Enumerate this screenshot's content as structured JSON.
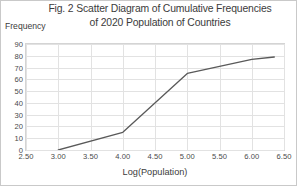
{
  "chart_data": {
    "type": "line",
    "title": "Fig. 2 Scatter Diagram of Cumulative Frequencies of 2020 Population of Countries",
    "title_line1": "Fig. 2 Scatter Diagram of Cumulative Frequencies",
    "title_line2": "of 2020 Population of Countries",
    "xlabel": "Log(Population)",
    "ylabel": "Frequency",
    "xlim": [
      2.5,
      6.5
    ],
    "ylim": [
      0,
      90
    ],
    "xticks": [
      "2.50",
      "3.00",
      "3.50",
      "4.00",
      "4.50",
      "5.00",
      "5.50",
      "6.00",
      "6.50"
    ],
    "xtick_values": [
      2.5,
      3.0,
      3.5,
      4.0,
      4.5,
      5.0,
      5.5,
      6.0,
      6.5
    ],
    "yticks": [
      "0",
      "10",
      "20",
      "30",
      "40",
      "50",
      "60",
      "70",
      "80",
      "90"
    ],
    "ytick_values": [
      0,
      10,
      20,
      30,
      40,
      50,
      60,
      70,
      80,
      90
    ],
    "grid": true,
    "legend": false,
    "line_color": "#595959",
    "x": [
      3.0,
      4.0,
      5.0,
      6.0,
      6.35
    ],
    "y": [
      0,
      15,
      65,
      77,
      79
    ],
    "series": [
      {
        "name": "Cumulative Frequency",
        "points": [
          {
            "x": 3.0,
            "y": 0
          },
          {
            "x": 4.0,
            "y": 15
          },
          {
            "x": 5.0,
            "y": 65
          },
          {
            "x": 6.0,
            "y": 77
          },
          {
            "x": 6.35,
            "y": 79
          }
        ]
      }
    ]
  }
}
